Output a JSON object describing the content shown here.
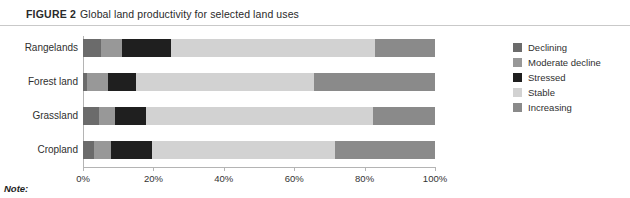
{
  "figure": {
    "label": "FIGURE 2",
    "title": "Global land productivity for selected land uses"
  },
  "note": {
    "label": "Note:"
  },
  "legend": {
    "position": "right",
    "items": [
      {
        "label": "Declining",
        "color": "#6b6b6b"
      },
      {
        "label": "Moderate decline",
        "color": "#989898"
      },
      {
        "label": "Stressed",
        "color": "#1f1f1f"
      },
      {
        "label": "Stable",
        "color": "#d2d2d2"
      },
      {
        "label": "Increasing",
        "color": "#8a8a8a"
      }
    ]
  },
  "chart_data": {
    "type": "bar",
    "orientation": "horizontal",
    "stacked": true,
    "normalized": true,
    "title": "Global land productivity for selected land uses",
    "xlabel": "",
    "ylabel": "",
    "xlim": [
      0,
      100
    ],
    "grid": false,
    "legend_position": "right",
    "categories": [
      "Rangelands",
      "Forest land",
      "Grassland",
      "Cropland"
    ],
    "xticks": [
      0,
      20,
      40,
      60,
      80,
      100
    ],
    "xtick_labels": [
      "0%",
      "20%",
      "40%",
      "60%",
      "80%",
      "100%"
    ],
    "series": [
      {
        "name": "Declining",
        "color": "#6b6b6b",
        "values": [
          5.0,
          1.2,
          4.5,
          3.0
        ]
      },
      {
        "name": "Moderate decline",
        "color": "#989898",
        "values": [
          6.0,
          5.8,
          4.5,
          5.0
        ]
      },
      {
        "name": "Stressed",
        "color": "#1f1f1f",
        "values": [
          14.0,
          8.0,
          9.0,
          11.5
        ]
      },
      {
        "name": "Stable",
        "color": "#d2d2d2",
        "values": [
          58.0,
          50.5,
          64.5,
          52.0
        ]
      },
      {
        "name": "Increasing",
        "color": "#8a8a8a",
        "values": [
          17.0,
          34.5,
          17.5,
          28.5
        ]
      }
    ]
  }
}
